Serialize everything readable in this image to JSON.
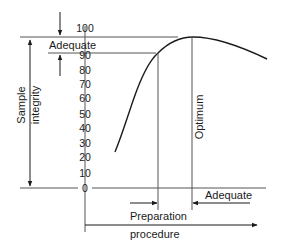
{
  "diagram": {
    "y_axis": {
      "label_line1": "Sample",
      "label_line2": "integrity",
      "ticks": [
        "100",
        "90",
        "80",
        "70",
        "60",
        "50",
        "40",
        "30",
        "20",
        "10",
        "0"
      ]
    },
    "x_axis": {
      "label_line1": "Preparation",
      "label_line2": "procedure"
    },
    "annotations": {
      "top_band": "Adequate",
      "optimum": "Optimum",
      "right_range": "Adequate"
    },
    "colors": {
      "line": "#1a1a1a",
      "thin_line": "#555555"
    }
  }
}
